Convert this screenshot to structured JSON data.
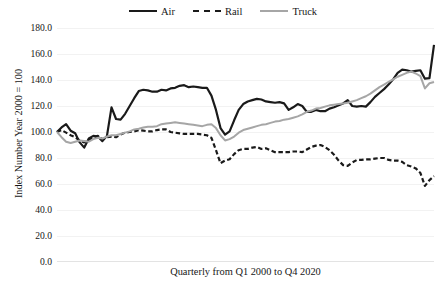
{
  "chart_data": {
    "type": "line",
    "title": "",
    "subtitle": "",
    "xlabel": "Quarterly from Q1 2000 to Q4 2020",
    "ylabel": "Index Number Year 2000 = 100",
    "ylim": [
      0.0,
      180.0
    ],
    "ytick_step": 20.0,
    "ytick_labels": [
      "180.0",
      "160.0",
      "140.0",
      "120.0",
      "100.0",
      "80.0",
      "60.0",
      "40.0",
      "20.0",
      "0.0"
    ],
    "ytick_values": [
      180.0,
      160.0,
      140.0,
      120.0,
      100.0,
      80.0,
      60.0,
      40.0,
      20.0,
      0.0
    ],
    "xtick_labels": [],
    "grid": true,
    "grid_axis": "y",
    "legend_position": "top-center",
    "x_range_description": "Quarterly from Q1 2000 to Q4 2020",
    "x_count": 84,
    "x": [
      "Q1 2000",
      "Q2 2000",
      "Q3 2000",
      "Q4 2000",
      "Q1 2001",
      "Q2 2001",
      "Q3 2001",
      "Q4 2001",
      "Q1 2002",
      "Q2 2002",
      "Q3 2002",
      "Q4 2002",
      "Q1 2003",
      "Q2 2003",
      "Q3 2003",
      "Q4 2003",
      "Q1 2004",
      "Q2 2004",
      "Q3 2004",
      "Q4 2004",
      "Q1 2005",
      "Q2 2005",
      "Q3 2005",
      "Q4 2005",
      "Q1 2006",
      "Q2 2006",
      "Q3 2006",
      "Q4 2006",
      "Q1 2007",
      "Q2 2007",
      "Q3 2007",
      "Q4 2007",
      "Q1 2008",
      "Q2 2008",
      "Q3 2008",
      "Q4 2008",
      "Q1 2009",
      "Q2 2009",
      "Q3 2009",
      "Q4 2009",
      "Q1 2010",
      "Q2 2010",
      "Q3 2010",
      "Q4 2010",
      "Q1 2011",
      "Q2 2011",
      "Q3 2011",
      "Q4 2011",
      "Q1 2012",
      "Q2 2012",
      "Q3 2012",
      "Q4 2012",
      "Q1 2013",
      "Q2 2013",
      "Q3 2013",
      "Q4 2013",
      "Q1 2014",
      "Q2 2014",
      "Q3 2014",
      "Q4 2014",
      "Q1 2015",
      "Q2 2015",
      "Q3 2015",
      "Q4 2015",
      "Q1 2016",
      "Q2 2016",
      "Q3 2016",
      "Q4 2016",
      "Q1 2017",
      "Q2 2017",
      "Q3 2017",
      "Q4 2017",
      "Q1 2018",
      "Q2 2018",
      "Q3 2018",
      "Q4 2018",
      "Q1 2019",
      "Q2 2019",
      "Q3 2019",
      "Q4 2019",
      "Q1 2020",
      "Q2 2020",
      "Q3 2020",
      "Q4 2020"
    ],
    "series": [
      {
        "name": "Air",
        "color": "#1a1a1a",
        "style": "solid",
        "width": 2.2,
        "values": [
          100.0,
          103.5,
          106.0,
          101.0,
          99.0,
          92.0,
          88.0,
          95.0,
          97.0,
          96.5,
          93.0,
          97.0,
          119.0,
          110.0,
          109.5,
          114.0,
          120.0,
          126.0,
          131.5,
          132.5,
          132.0,
          131.0,
          131.0,
          132.5,
          132.0,
          133.5,
          134.0,
          135.5,
          136.0,
          134.5,
          135.0,
          134.5,
          134.0,
          134.0,
          128.0,
          117.0,
          103.0,
          98.0,
          100.5,
          109.0,
          117.0,
          121.5,
          123.5,
          124.5,
          125.5,
          125.0,
          123.5,
          123.0,
          122.5,
          123.0,
          122.0,
          117.0,
          119.0,
          121.5,
          120.0,
          115.5,
          115.5,
          117.0,
          116.0,
          116.0,
          118.0,
          119.0,
          120.5,
          122.0,
          124.5,
          120.0,
          119.5,
          120.0,
          119.5,
          123.0,
          127.0,
          130.0,
          133.0,
          136.5,
          140.5,
          145.5,
          148.0,
          147.5,
          146.5,
          147.0,
          147.5,
          141.0,
          141.5,
          167.0
        ]
      },
      {
        "name": "Rail",
        "color": "#1a1a1a",
        "style": "dashed",
        "width": 2.2,
        "values": [
          100.0,
          101.5,
          99.5,
          97.5,
          96.0,
          93.5,
          92.0,
          94.0,
          96.0,
          97.0,
          94.5,
          96.0,
          96.5,
          96.0,
          98.0,
          99.5,
          100.0,
          100.5,
          101.5,
          101.0,
          100.5,
          100.5,
          101.5,
          102.0,
          102.0,
          100.0,
          99.5,
          99.0,
          98.5,
          98.5,
          98.5,
          98.5,
          98.0,
          97.5,
          95.5,
          86.0,
          76.0,
          78.0,
          79.0,
          83.0,
          86.0,
          87.0,
          87.0,
          88.0,
          88.5,
          87.0,
          87.5,
          86.0,
          84.5,
          84.5,
          84.5,
          84.5,
          85.0,
          85.0,
          84.5,
          86.5,
          88.5,
          89.5,
          90.0,
          88.5,
          86.0,
          82.5,
          78.0,
          74.5,
          74.0,
          76.5,
          78.5,
          78.5,
          79.0,
          79.0,
          79.5,
          80.0,
          80.0,
          78.5,
          78.0,
          78.0,
          77.0,
          74.5,
          73.5,
          72.0,
          68.5,
          58.5,
          63.0,
          66.0
        ]
      },
      {
        "name": "Truck",
        "color": "#a6a6a6",
        "style": "solid",
        "width": 2.0,
        "values": [
          100.0,
          96.0,
          92.5,
          91.5,
          92.5,
          93.5,
          93.0,
          92.5,
          94.5,
          95.5,
          95.0,
          96.5,
          97.5,
          97.5,
          98.5,
          99.5,
          100.5,
          102.0,
          102.5,
          103.5,
          104.0,
          104.0,
          104.5,
          106.0,
          106.5,
          107.0,
          107.5,
          107.0,
          106.5,
          106.0,
          105.5,
          105.0,
          104.5,
          105.5,
          106.0,
          103.0,
          97.5,
          93.5,
          94.5,
          96.5,
          99.5,
          101.5,
          102.5,
          103.5,
          104.5,
          105.5,
          106.0,
          107.0,
          108.0,
          108.5,
          109.5,
          110.0,
          111.0,
          112.0,
          113.5,
          115.5,
          116.5,
          118.0,
          118.5,
          119.5,
          120.5,
          121.0,
          121.5,
          122.0,
          122.5,
          123.5,
          124.5,
          126.0,
          127.5,
          129.5,
          132.0,
          134.5,
          136.5,
          138.5,
          140.5,
          142.5,
          144.0,
          145.5,
          146.5,
          145.0,
          143.0,
          133.5,
          137.5,
          138.5
        ]
      }
    ]
  },
  "legend": {
    "entries": [
      {
        "label": "Air",
        "style": "solid",
        "color": "#1a1a1a"
      },
      {
        "label": "Rail",
        "style": "dashed",
        "color": "#1a1a1a"
      },
      {
        "label": "Truck",
        "style": "solid",
        "color": "#a6a6a6"
      }
    ]
  },
  "axes": {
    "y_title": "Index Number Year 2000 = 100",
    "x_title": "Quarterly from Q1 2000 to Q4 2020"
  },
  "colors": {
    "air": "#1a1a1a",
    "rail": "#1a1a1a",
    "truck": "#a6a6a6",
    "gridline": "#f2f2f2",
    "text": "#171717",
    "background": "#ffffff"
  }
}
